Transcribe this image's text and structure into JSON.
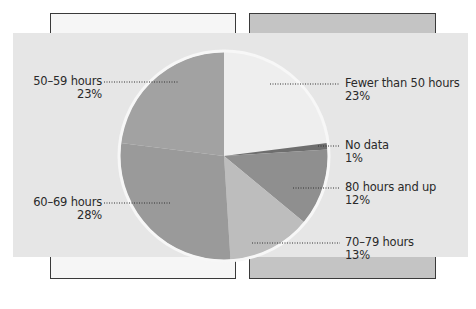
{
  "chart_data": {
    "type": "pie",
    "title": "",
    "slices": [
      {
        "label": "Fewer than 50 hours",
        "value": 23,
        "pct_label": "23%",
        "color": "#eeeeee"
      },
      {
        "label": "No data",
        "value": 1,
        "pct_label": "1%",
        "color": "#6e6e6e"
      },
      {
        "label": "80 hours and up",
        "value": 12,
        "pct_label": "12%",
        "color": "#8f8f8f"
      },
      {
        "label": "70–79 hours",
        "value": 13,
        "pct_label": "13%",
        "color": "#bdbdbd"
      },
      {
        "label": "60–69 hours",
        "value": 28,
        "pct_label": "28%",
        "color": "#9a9a9a"
      },
      {
        "label": "50–59 hours",
        "value": 23,
        "pct_label": "23%",
        "color": "#a2a2a2"
      }
    ],
    "legend": "callout labels with dotted leader lines",
    "start_angle": "12 o'clock, clockwise"
  },
  "labels": {
    "fewer50": {
      "name": "Fewer than 50 hours",
      "pct": "23%"
    },
    "nodata": {
      "name": "No data",
      "pct": "1%"
    },
    "h80": {
      "name": "80 hours and up",
      "pct": "12%"
    },
    "h70": {
      "name": "70–79 hours",
      "pct": "13%"
    },
    "h60": {
      "name": "60–69 hours",
      "pct": "28%"
    },
    "h50": {
      "name": "50–59 hours",
      "pct": "23%"
    }
  }
}
